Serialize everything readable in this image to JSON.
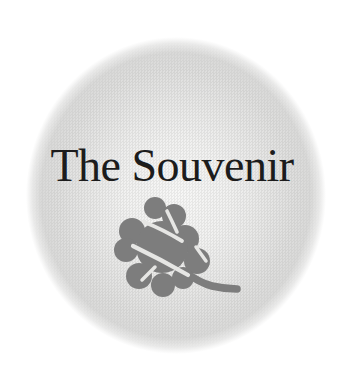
{
  "logo": {
    "title": "The Souvenir",
    "icon": "leaf-icon"
  },
  "colors": {
    "page_background": "#ffffff",
    "circle_center": "#f7f7f6",
    "circle_edge": "#d9d9d8",
    "title_text": "#1c1c1c",
    "leaf_fill": "#7d7d7d",
    "leaf_vein": "#e6e6e4"
  }
}
